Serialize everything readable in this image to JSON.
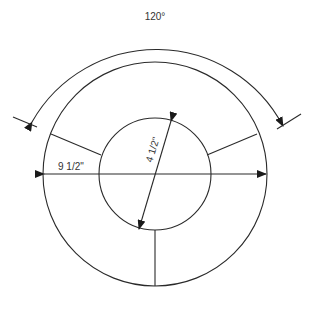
{
  "diagram": {
    "type": "technical-drawing",
    "labels": {
      "angle": "120°",
      "outer_diameter": "9 1/2\"",
      "inner_diameter": "4 1/2\""
    },
    "geometry": {
      "center": [
        155,
        174
      ],
      "outer_radius": 112,
      "inner_radius": 56,
      "angle_arc_radius": 144,
      "segment_divider_angles_deg": [
        90,
        210,
        330
      ],
      "angle_span_deg": 120
    },
    "colors": {
      "line": "#2a2a2a",
      "text": "#333333",
      "background": "#ffffff"
    }
  }
}
